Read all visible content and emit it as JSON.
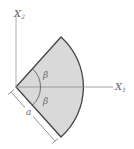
{
  "diagram": {
    "type": "circular-sector",
    "axes": {
      "x1": {
        "label": "X",
        "subscript": "1"
      },
      "x2": {
        "label": "X",
        "subscript": "2"
      }
    },
    "angles": [
      {
        "label": "β",
        "position": "above-x1"
      },
      {
        "label": "β",
        "position": "below-x1"
      }
    ],
    "dimension": {
      "label": "a",
      "meaning": "sector radius"
    },
    "colors": {
      "fill": "#d9d9d9",
      "edge": "#444444",
      "axis": "#9a9a9a",
      "text": "#666666"
    }
  }
}
